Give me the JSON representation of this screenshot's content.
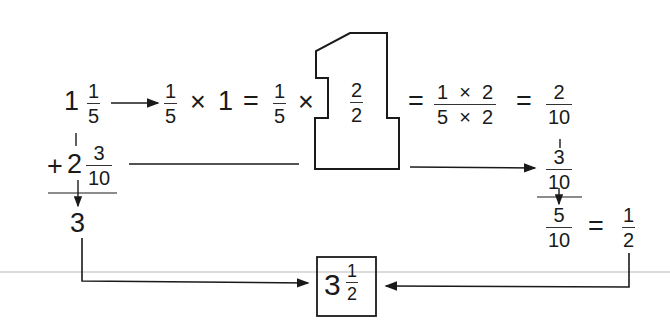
{
  "diagram": {
    "type": "mixed-number-addition-flow",
    "row1": {
      "mixed": {
        "whole": "1",
        "num": "1",
        "den": "5"
      },
      "step1": {
        "num": "1",
        "den": "5"
      },
      "times": "×",
      "one": "1",
      "equals": "=",
      "step2": {
        "num": "1",
        "den": "5"
      },
      "times2": "×",
      "big_one_fraction": {
        "num": "2",
        "den": "2"
      },
      "equals2": "=",
      "product": {
        "num": "1  ×  2",
        "den": "5  ×  2"
      },
      "equals3": "=",
      "result": {
        "num": "2",
        "den": "10"
      }
    },
    "row2": {
      "plus": "+",
      "mixed": {
        "whole": "2",
        "num": "3",
        "den": "10"
      },
      "carried": {
        "num": "3",
        "den": "10"
      }
    },
    "sum_whole": "3",
    "sum_fraction": {
      "num": "5",
      "den": "10"
    },
    "simplify_equals": "=",
    "simplified": {
      "num": "1",
      "den": "2"
    },
    "final_answer": {
      "whole": "3",
      "num": "1",
      "den": "2"
    },
    "colors": {
      "ink": "#1a1a1a",
      "background": "#ffffff",
      "faint_line": "#d8d8d8"
    }
  }
}
